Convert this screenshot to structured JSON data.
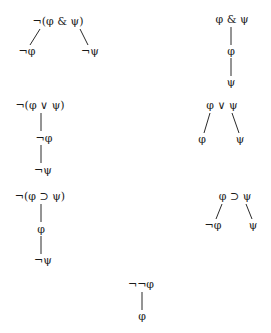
{
  "diagram": {
    "trees": [
      {
        "name": "negated-conjunction",
        "type": "branching",
        "root": "¬(φ & ψ)",
        "children": [
          "¬φ",
          "¬ψ"
        ]
      },
      {
        "name": "conjunction",
        "type": "linear",
        "root": "φ & ψ",
        "children": [
          "φ",
          "ψ"
        ]
      },
      {
        "name": "negated-disjunction",
        "type": "linear",
        "root": "¬(φ ∨ ψ)",
        "children": [
          "¬φ",
          "¬ψ"
        ]
      },
      {
        "name": "disjunction",
        "type": "branching",
        "root": "φ ∨ ψ",
        "children": [
          "φ",
          "ψ"
        ]
      },
      {
        "name": "negated-conditional",
        "type": "linear",
        "root": "¬(φ ⊃ ψ)",
        "children": [
          "φ",
          "¬ψ"
        ]
      },
      {
        "name": "conditional",
        "type": "branching",
        "root": "φ ⊃ ψ",
        "children": [
          "¬φ",
          "ψ"
        ]
      },
      {
        "name": "double-negation",
        "type": "linear",
        "root": "¬¬φ",
        "children": [
          "φ"
        ]
      }
    ]
  }
}
